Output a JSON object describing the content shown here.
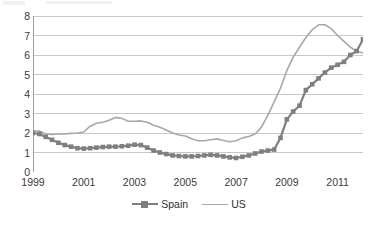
{
  "chart_data": {
    "type": "line",
    "title": "",
    "subtitle": "",
    "xlabel": "",
    "ylabel": "",
    "xlim": [
      1999.0,
      2012.0
    ],
    "ylim": [
      0,
      8
    ],
    "y_ticks": [
      0,
      1,
      2,
      3,
      4,
      5,
      6,
      7,
      8
    ],
    "x_ticks": [
      1999,
      2001,
      2003,
      2005,
      2007,
      2009,
      2011
    ],
    "x_tick_labels": [
      "1999",
      "2001",
      "2003",
      "2005",
      "2007",
      "2009",
      "2011"
    ],
    "x_minor_tick_step": 0.5,
    "grid": "horizontal",
    "legend_position": "bottom-center",
    "colors": {
      "spain": "#7f7f7f",
      "us": "#a8a8a8",
      "grid": "#c8c8c8",
      "axis": "#a0a0a0",
      "text": "#3a3a3a",
      "background": "#ffffff"
    },
    "series": [
      {
        "name": "Spain",
        "marker": "square",
        "color": "#7f7f7f",
        "x": [
          1999.0,
          1999.25,
          1999.5,
          1999.75,
          2000.0,
          2000.25,
          2000.5,
          2000.75,
          2001.0,
          2001.25,
          2001.5,
          2001.75,
          2002.0,
          2002.25,
          2002.5,
          2002.75,
          2003.0,
          2003.25,
          2003.5,
          2003.75,
          2004.0,
          2004.25,
          2004.5,
          2004.75,
          2005.0,
          2005.25,
          2005.5,
          2005.75,
          2006.0,
          2006.25,
          2006.5,
          2006.75,
          2007.0,
          2007.25,
          2007.5,
          2007.75,
          2008.0,
          2008.25,
          2008.5,
          2008.75,
          2009.0,
          2009.25,
          2009.5,
          2009.75,
          2010.0,
          2010.25,
          2010.5,
          2010.75,
          2011.0,
          2011.25,
          2011.5,
          2011.75,
          2012.0
        ],
        "values": [
          2.0,
          1.95,
          1.8,
          1.65,
          1.5,
          1.38,
          1.3,
          1.22,
          1.2,
          1.22,
          1.25,
          1.28,
          1.3,
          1.3,
          1.32,
          1.35,
          1.4,
          1.38,
          1.25,
          1.1,
          1.0,
          0.92,
          0.85,
          0.82,
          0.8,
          0.8,
          0.82,
          0.85,
          0.88,
          0.85,
          0.8,
          0.75,
          0.72,
          0.78,
          0.85,
          0.95,
          1.05,
          1.1,
          1.15,
          1.75,
          2.7,
          3.1,
          3.4,
          4.2,
          4.5,
          4.8,
          5.1,
          5.35,
          5.5,
          5.65,
          6.0,
          6.2,
          6.8
        ]
      },
      {
        "name": "US",
        "marker": "none",
        "color": "#a8a8a8",
        "x": [
          1999.0,
          1999.25,
          1999.5,
          1999.75,
          2000.0,
          2000.25,
          2000.5,
          2000.75,
          2001.0,
          2001.25,
          2001.5,
          2001.75,
          2002.0,
          2002.25,
          2002.5,
          2002.75,
          2003.0,
          2003.25,
          2003.5,
          2003.75,
          2004.0,
          2004.25,
          2004.5,
          2004.75,
          2005.0,
          2005.25,
          2005.5,
          2005.75,
          2006.0,
          2006.25,
          2006.5,
          2006.75,
          2007.0,
          2007.25,
          2007.5,
          2007.75,
          2008.0,
          2008.25,
          2008.5,
          2008.75,
          2009.0,
          2009.25,
          2009.5,
          2009.75,
          2010.0,
          2010.25,
          2010.5,
          2010.75,
          2011.0,
          2011.25,
          2011.5,
          2011.75,
          2012.0
        ],
        "values": [
          2.1,
          2.1,
          1.95,
          1.92,
          1.95,
          1.95,
          1.98,
          2.0,
          2.05,
          2.35,
          2.5,
          2.55,
          2.65,
          2.8,
          2.75,
          2.6,
          2.6,
          2.62,
          2.55,
          2.4,
          2.3,
          2.15,
          2.0,
          1.9,
          1.85,
          1.7,
          1.6,
          1.6,
          1.65,
          1.7,
          1.62,
          1.55,
          1.6,
          1.75,
          1.82,
          1.95,
          2.3,
          2.9,
          3.6,
          4.3,
          5.2,
          5.9,
          6.4,
          6.9,
          7.3,
          7.55,
          7.55,
          7.35,
          7.0,
          6.7,
          6.4,
          6.2,
          6.1
        ]
      }
    ]
  },
  "legend": {
    "items": [
      {
        "label": "Spain"
      },
      {
        "label": "US"
      }
    ]
  }
}
